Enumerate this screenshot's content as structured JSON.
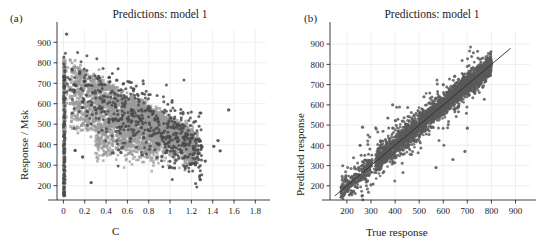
{
  "figure": {
    "background": "#ffffff",
    "panels": [
      {
        "label": "(a)",
        "title": "Predictions: model 1"
      },
      {
        "label": "(b)",
        "title": "Predictions: model 1"
      }
    ]
  },
  "chart_data": [
    {
      "type": "scatter",
      "panel": "(a)",
      "title": "Predictions: model 1",
      "xlabel": "C",
      "ylabel": "Response / Msk",
      "xlim": [
        -0.06,
        1.9
      ],
      "ylim": [
        130,
        960
      ],
      "xticks": [
        0,
        0.2,
        0.4,
        0.6,
        0.8,
        1,
        1.2,
        1.4,
        1.6,
        1.8
      ],
      "xticklabels": [
        "0",
        "0.2",
        "0.4",
        "0.6",
        "0.8",
        "1",
        "1.2",
        "1.4",
        "1.6",
        "1.8"
      ],
      "yticks": [
        200,
        300,
        400,
        500,
        600,
        700,
        800,
        900
      ],
      "yticklabels": [
        "200",
        "300",
        "400",
        "500",
        "600",
        "700",
        "800",
        "900"
      ],
      "grid": true,
      "grid_color": "#e8e8e8",
      "legend": "none",
      "series": [
        {
          "name": "observed",
          "color": "#9a9a9a",
          "marker": "square",
          "size": 2.6,
          "description": "dense gray cloud: high at C near 0 (750-820) decaying toward 400-480 at C near 1.2, plus a vertical column of points at C=0 spanning 150-820"
        },
        {
          "name": "predicted",
          "color": "#4a4a4a",
          "marker": "circle",
          "size": 2.4,
          "description": "darker scattered overlay points following the same decaying trend with wider spread"
        }
      ]
    },
    {
      "type": "scatter",
      "panel": "(b)",
      "title": "Predictions: model 1",
      "xlabel": "True response",
      "ylabel": "Predicted response",
      "xlim": [
        130,
        960
      ],
      "ylim": [
        130,
        960
      ],
      "xticks": [
        200,
        300,
        400,
        500,
        600,
        700,
        800,
        900
      ],
      "xticklabels": [
        "200",
        "300",
        "400",
        "500",
        "600",
        "700",
        "800",
        "900"
      ],
      "yticks": [
        200,
        300,
        400,
        500,
        600,
        700,
        800,
        900
      ],
      "yticklabels": [
        "200",
        "300",
        "400",
        "500",
        "600",
        "700",
        "800",
        "900"
      ],
      "grid": true,
      "grid_color": "#e8e8e8",
      "legend": "none",
      "identity_line": {
        "from": [
          150,
          150
        ],
        "to": [
          880,
          880
        ],
        "color": "#2b2b2b"
      },
      "series": [
        {
          "name": "predicted-vs-true",
          "color": "#5a5a5a",
          "marker": "circle",
          "size": 2.2,
          "description": "dense elongated cloud hugging the identity line, concentrated 550-780, sparse cluster 180-300, scattered outliers"
        }
      ]
    }
  ]
}
